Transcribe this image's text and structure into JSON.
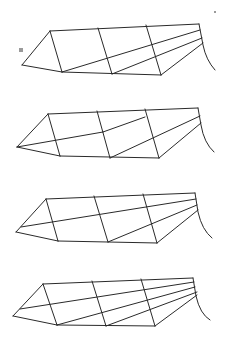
{
  "figure": {
    "background": "#ffffff",
    "stroke_color": "#2a2a2a",
    "panels": [
      {
        "id": "panel-1",
        "edges": [
          [
            22,
            65,
            50,
            31
          ],
          [
            22,
            65,
            62,
            72
          ],
          [
            50,
            31,
            199,
            24
          ],
          [
            62,
            72,
            161,
            75
          ],
          [
            50,
            31,
            62,
            72
          ],
          [
            98,
            28,
            112,
            74
          ],
          [
            146,
            25,
            161,
            75
          ],
          [
            62,
            72,
            200,
            30
          ],
          [
            112,
            74,
            202,
            38
          ],
          [
            161,
            75,
            203,
            43
          ]
        ],
        "tail": "M199,24 L203,45 Q206,60 215,70"
      },
      {
        "id": "panel-2",
        "edges": [
          [
            17,
            147,
            48,
            114
          ],
          [
            17,
            147,
            60,
            156
          ],
          [
            48,
            114,
            198,
            108
          ],
          [
            60,
            156,
            159,
            158
          ],
          [
            48,
            114,
            60,
            156
          ],
          [
            97,
            111,
            110,
            158
          ],
          [
            145,
            109,
            159,
            158
          ],
          [
            17,
            147,
            103,
            132
          ],
          [
            103,
            132,
            145,
            117
          ],
          [
            110,
            158,
            200,
            116
          ],
          [
            159,
            158,
            201,
            123
          ]
        ],
        "tail": "M198,108 L201,125 Q204,143 214,152"
      },
      {
        "id": "panel-3",
        "edges": [
          [
            16,
            232,
            46,
            199
          ],
          [
            16,
            232,
            58,
            241
          ],
          [
            46,
            199,
            195,
            193
          ],
          [
            58,
            241,
            157,
            243
          ],
          [
            46,
            199,
            58,
            241
          ],
          [
            94,
            196,
            108,
            242
          ],
          [
            143,
            194,
            157,
            243
          ],
          [
            21,
            227,
            196,
            199
          ],
          [
            108,
            242,
            197,
            205
          ],
          [
            157,
            243,
            198,
            210
          ]
        ],
        "tail": "M195,193 L198,212 Q202,230 212,238"
      },
      {
        "id": "panel-4",
        "edges": [
          [
            13,
            316,
            43,
            284
          ],
          [
            13,
            316,
            57,
            325
          ],
          [
            43,
            284,
            193,
            278
          ],
          [
            57,
            325,
            155,
            326
          ],
          [
            43,
            284,
            57,
            325
          ],
          [
            92,
            281,
            106,
            326
          ],
          [
            141,
            279,
            155,
            326
          ],
          [
            20,
            309,
            194,
            282
          ],
          [
            57,
            325,
            195,
            287
          ],
          [
            106,
            326,
            197,
            292
          ],
          [
            155,
            326,
            197,
            295
          ]
        ],
        "tail": "M193,278 L196,296 Q200,314 210,320"
      }
    ],
    "marks": [
      {
        "name": "smudge-mark",
        "x": 19,
        "y": 48,
        "w": 4,
        "h": 4
      },
      {
        "name": "dot-mark",
        "x": 214,
        "y": 11,
        "w": 2,
        "h": 2
      }
    ]
  }
}
